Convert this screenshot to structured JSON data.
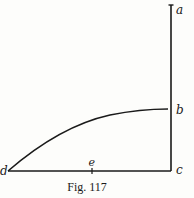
{
  "figure": {
    "caption": "Fig. 117",
    "labels": {
      "a": "a",
      "b": "b",
      "c": "c",
      "d": "d",
      "e": "e"
    },
    "colors": {
      "ink": "#1a1a1a",
      "paper": "#fdfdfb"
    }
  }
}
